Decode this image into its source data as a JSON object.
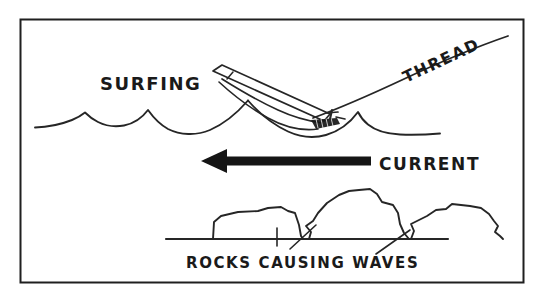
{
  "figure": {
    "background_color": "#ffffff",
    "ink_color": "#262626",
    "border": {
      "present": true,
      "color": "#1f1f1f",
      "x": 20,
      "y": 19,
      "width": 504,
      "height": 264
    }
  },
  "labels": {
    "surfing": "SURFING",
    "thread": "THREAD",
    "current": "CURRENT",
    "rocks_causing_waves": "ROCKS CAUSING WAVES"
  },
  "elements": {
    "water_surface": {
      "name": "wave-line",
      "description": "undulating water surface with four crests"
    },
    "thread_line": {
      "name": "thread-line",
      "description": "angled line running up to the top right corner"
    },
    "fly": {
      "name": "fly-body",
      "description": "elongated hackled fly riding the wave"
    },
    "hook": {
      "name": "hook-and-hackle",
      "description": "hatched hook shank at the waterline"
    },
    "current_arrow": {
      "name": "current-arrow",
      "direction": "left",
      "color": "#151515",
      "x_start": 201,
      "x_end": 371,
      "y": 161
    },
    "riverbed": {
      "name": "riverbed-line",
      "x_start": 166,
      "x_end": 448,
      "y": 239
    },
    "rocks": [
      {
        "name": "rock-left",
        "x": 212,
        "width": 92
      },
      {
        "name": "rock-center",
        "x": 309,
        "width": 106
      },
      {
        "name": "rock-right",
        "x": 410,
        "width": 98
      }
    ]
  }
}
